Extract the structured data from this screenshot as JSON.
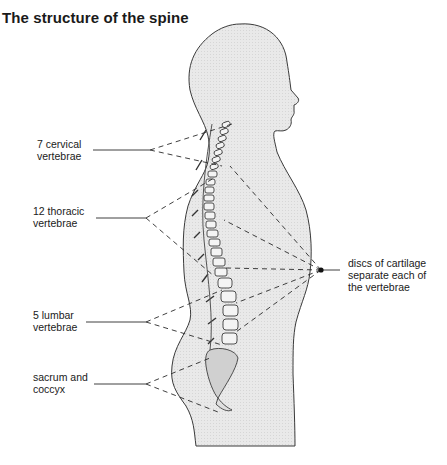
{
  "header": {
    "faint_running_title": "...",
    "title": "The structure of the spine"
  },
  "labels": {
    "cervical": {
      "line1": "7 cervical",
      "line2": "vertebrae"
    },
    "thoracic": {
      "line1": "12 thoracic",
      "line2": "vertebrae"
    },
    "lumbar": {
      "line1": "5 lumbar",
      "line2": "vertebrae"
    },
    "sacrum": {
      "line1": "sacrum and",
      "line2": "coccyx"
    },
    "discs": {
      "line1": "discs of cartilage",
      "line2": "separate each of",
      "line3": "the vertebrae"
    }
  },
  "colors": {
    "body_fill": "#e6e6e6",
    "outline": "#3a3a3a",
    "bone_fill": "#f2f2f2",
    "bone_stroke": "#2a2a2a"
  }
}
